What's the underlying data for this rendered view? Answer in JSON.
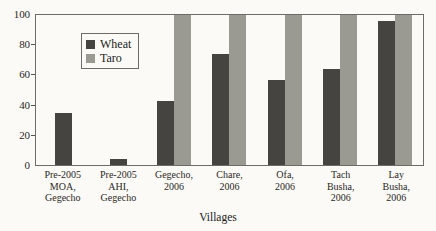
{
  "chart_data": {
    "type": "bar",
    "title": "",
    "xlabel": "Villages",
    "ylabel": "",
    "ylim": [
      0,
      100
    ],
    "yticks": [
      0,
      20,
      40,
      60,
      80,
      100
    ],
    "grid": false,
    "legend_position": "top-left",
    "categories": [
      "Pre-2005\nMOA,\nGegecho",
      "Pre-2005\nAHI,\nGegecho",
      "Gegecho,\n2006",
      "Chare,\n2006",
      "Ofa,\n2006",
      "Tach\nBusha,\n2006",
      "Lay\nBusha,\n2006"
    ],
    "series": [
      {
        "name": "Wheat",
        "color": "#464440",
        "values": [
          35,
          4,
          43,
          74,
          57,
          64,
          96
        ]
      },
      {
        "name": "Taro",
        "color": "#9a9a93",
        "values": [
          0,
          0,
          100,
          100,
          100,
          100,
          100
        ]
      }
    ]
  },
  "axis": {
    "y_tick_labels": [
      "100",
      "80",
      "60",
      "40",
      "20",
      "0"
    ],
    "x_title": "Villages"
  },
  "legend": {
    "entries": [
      {
        "label": "Wheat",
        "color": "#464440"
      },
      {
        "label": "Taro",
        "color": "#9a9a93"
      }
    ]
  }
}
